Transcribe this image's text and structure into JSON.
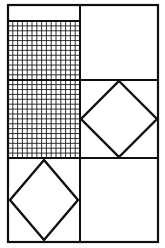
{
  "figure": {
    "background_color": "#ffffff",
    "line_color": "#101010",
    "canvas": {
      "width": 165,
      "height": 248
    },
    "frame": {
      "name": "outer-rectangle",
      "x": 8,
      "y": 5,
      "width": 150,
      "height": 237,
      "stroke_width": 2.2
    },
    "dividers": {
      "vertical_x": [
        80
      ],
      "horizontal_y": [
        21,
        80,
        158
      ]
    },
    "panels": [
      {
        "id": "top-left-strip",
        "label": "blank strip",
        "content": "empty",
        "x": 8,
        "y": 5,
        "width": 72,
        "height": 16
      },
      {
        "id": "left-grid-upper",
        "label": "hatched grid upper",
        "content": "grid",
        "x": 8,
        "y": 21,
        "width": 72,
        "height": 59
      },
      {
        "id": "top-right-square",
        "label": "plain square",
        "content": "empty",
        "x": 80,
        "y": 5,
        "width": 78,
        "height": 75
      },
      {
        "id": "left-grid-lower",
        "label": "hatched grid lower",
        "content": "grid",
        "x": 8,
        "y": 80,
        "width": 72,
        "height": 78
      },
      {
        "id": "mid-right-diamond",
        "label": "square with inscribed diamond",
        "content": "diamond",
        "x": 80,
        "y": 80,
        "width": 78,
        "height": 78
      },
      {
        "id": "bottom-left-diamond",
        "label": "square with inscribed diamond",
        "content": "diamond",
        "x": 8,
        "y": 158,
        "width": 72,
        "height": 84
      },
      {
        "id": "bottom-right-square",
        "label": "plain square",
        "content": "empty",
        "x": 80,
        "y": 158,
        "width": 78,
        "height": 84
      }
    ],
    "grid": {
      "cell_size": 5,
      "columns": 15,
      "rows": 28,
      "x": 8,
      "y": 21,
      "width": 72,
      "height": 137,
      "line_color": "#1a1a1a",
      "line_width": 0.9
    },
    "diamonds": [
      {
        "id": "diamond-mid-right",
        "points": "119,81 157,119 119,157 81,119",
        "inscribed_in": "mid-right-diamond"
      },
      {
        "id": "diamond-bottom-left",
        "points": "44,160 78,200 44,240 10,200",
        "inscribed_in": "bottom-left-diamond"
      }
    ]
  }
}
